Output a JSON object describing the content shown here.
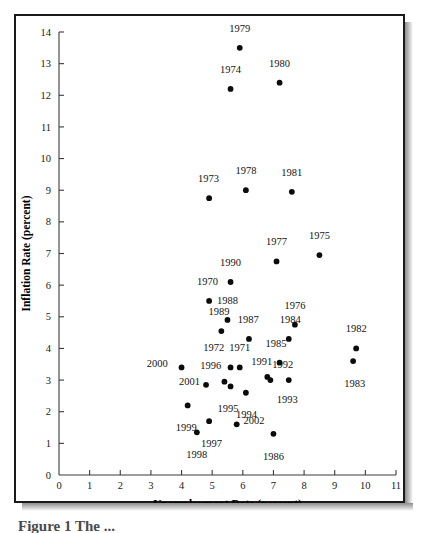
{
  "figure": {
    "caption": "Figure 1 The ..."
  },
  "chart_data": {
    "type": "scatter",
    "title": "",
    "xlabel": "Unemployment Rate (percent)",
    "ylabel": "Inflation Rate (percent)",
    "xlim": [
      0,
      11
    ],
    "ylim": [
      0,
      14
    ],
    "xticks": [
      0,
      1,
      2,
      3,
      4,
      5,
      6,
      7,
      8,
      9,
      10,
      11
    ],
    "yticks": [
      0,
      1,
      2,
      3,
      4,
      5,
      6,
      7,
      8,
      9,
      10,
      11,
      12,
      13,
      14
    ],
    "xtick_labels": [
      "0",
      "1",
      "2",
      "3",
      "4",
      "5",
      "6",
      "7",
      "8",
      "9",
      "10",
      "11"
    ],
    "ytick_labels": [
      "0",
      "1",
      "2",
      "3",
      "4",
      "5",
      "6",
      "7",
      "8",
      "9",
      "10",
      "11",
      "12",
      "13",
      "14"
    ],
    "grid": false,
    "legend": false,
    "point_label_position": "above",
    "points": [
      {
        "label": "1970",
        "x": 4.9,
        "y": 5.5,
        "label_dx": -0.05,
        "label_dy": 0.62,
        "anchor": "middle"
      },
      {
        "label": "1971",
        "x": 5.9,
        "y": 3.4,
        "label_dx": 0.0,
        "label_dy": 0.62,
        "anchor": "middle"
      },
      {
        "label": "1972",
        "x": 5.6,
        "y": 3.4,
        "label_dx": -0.55,
        "label_dy": 0.62,
        "anchor": "middle"
      },
      {
        "label": "1973",
        "x": 4.9,
        "y": 8.75,
        "label_dx": -0.02,
        "label_dy": 0.62,
        "anchor": "middle"
      },
      {
        "label": "1974",
        "x": 5.6,
        "y": 12.2,
        "label_dx": 0.0,
        "label_dy": 0.62,
        "anchor": "middle"
      },
      {
        "label": "1975",
        "x": 8.5,
        "y": 6.95,
        "label_dx": 0.0,
        "label_dy": 0.62,
        "anchor": "middle"
      },
      {
        "label": "1976",
        "x": 7.7,
        "y": 4.75,
        "label_dx": 0.0,
        "label_dy": 0.62,
        "anchor": "middle"
      },
      {
        "label": "1977",
        "x": 7.1,
        "y": 6.75,
        "label_dx": 0.0,
        "label_dy": 0.62,
        "anchor": "middle"
      },
      {
        "label": "1978",
        "x": 6.1,
        "y": 9.0,
        "label_dx": 0.0,
        "label_dy": 0.62,
        "anchor": "middle"
      },
      {
        "label": "1979",
        "x": 5.9,
        "y": 13.5,
        "label_dx": 0.0,
        "label_dy": 0.62,
        "anchor": "middle"
      },
      {
        "label": "1980",
        "x": 7.2,
        "y": 12.4,
        "label_dx": 0.0,
        "label_dy": 0.62,
        "anchor": "middle"
      },
      {
        "label": "1981",
        "x": 7.6,
        "y": 8.95,
        "label_dx": 0.0,
        "label_dy": 0.62,
        "anchor": "middle"
      },
      {
        "label": "1982",
        "x": 9.7,
        "y": 4.0,
        "label_dx": 0.0,
        "label_dy": 0.62,
        "anchor": "middle"
      },
      {
        "label": "1983",
        "x": 9.6,
        "y": 3.6,
        "label_dx": 0.05,
        "label_dy": -0.7,
        "anchor": "middle"
      },
      {
        "label": "1984",
        "x": 7.5,
        "y": 4.3,
        "label_dx": 0.05,
        "label_dy": 0.62,
        "anchor": "middle"
      },
      {
        "label": "1985",
        "x": 7.2,
        "y": 3.55,
        "label_dx": -0.12,
        "label_dy": 0.62,
        "anchor": "middle"
      },
      {
        "label": "1986",
        "x": 7.0,
        "y": 1.3,
        "label_dx": 0.0,
        "label_dy": -0.7,
        "anchor": "middle"
      },
      {
        "label": "1987",
        "x": 6.2,
        "y": 4.3,
        "label_dx": -0.02,
        "label_dy": 0.62,
        "anchor": "middle"
      },
      {
        "label": "1988",
        "x": 5.5,
        "y": 4.9,
        "label_dx": 0.0,
        "label_dy": 0.62,
        "anchor": "middle"
      },
      {
        "label": "1989",
        "x": 5.3,
        "y": 4.55,
        "label_dx": -0.08,
        "label_dy": 0.62,
        "anchor": "middle"
      },
      {
        "label": "1990",
        "x": 5.6,
        "y": 6.1,
        "label_dx": 0.0,
        "label_dy": 0.62,
        "anchor": "middle"
      },
      {
        "label": "1991",
        "x": 6.8,
        "y": 3.1,
        "label_dx": -0.18,
        "label_dy": 0.5,
        "anchor": "middle"
      },
      {
        "label": "1992",
        "x": 7.5,
        "y": 3.0,
        "label_dx": -0.2,
        "label_dy": 0.5,
        "anchor": "middle"
      },
      {
        "label": "1993",
        "x": 6.9,
        "y": 3.0,
        "label_dx": 0.55,
        "label_dy": -0.62,
        "anchor": "middle"
      },
      {
        "label": "1994",
        "x": 6.1,
        "y": 2.6,
        "label_dx": 0.02,
        "label_dy": -0.7,
        "anchor": "middle"
      },
      {
        "label": "1995",
        "x": 5.6,
        "y": 2.8,
        "label_dx": -0.08,
        "label_dy": -0.7,
        "anchor": "middle"
      },
      {
        "label": "1996",
        "x": 5.4,
        "y": 2.95,
        "label_dx": -0.45,
        "label_dy": 0.5,
        "anchor": "middle"
      },
      {
        "label": "1997",
        "x": 4.9,
        "y": 1.7,
        "label_dx": 0.08,
        "label_dy": -0.7,
        "anchor": "middle"
      },
      {
        "label": "1998",
        "x": 4.5,
        "y": 1.35,
        "label_dx": 0.0,
        "label_dy": -0.7,
        "anchor": "middle"
      },
      {
        "label": "1999",
        "x": 4.2,
        "y": 2.2,
        "label_dx": -0.05,
        "label_dy": -0.7,
        "anchor": "middle"
      },
      {
        "label": "2000",
        "x": 4.0,
        "y": 3.4,
        "label_dx": -0.45,
        "label_dy": 0.12,
        "anchor": "end"
      },
      {
        "label": "2001",
        "x": 4.8,
        "y": 2.85,
        "label_dx": -0.2,
        "label_dy": 0.12,
        "anchor": "end"
      },
      {
        "label": "2002",
        "x": 5.8,
        "y": 1.6,
        "label_dx": 0.22,
        "label_dy": 0.12,
        "anchor": "start"
      }
    ]
  }
}
